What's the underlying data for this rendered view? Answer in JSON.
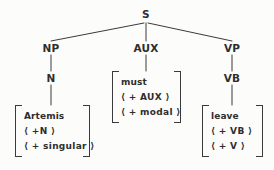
{
  "diagram": {
    "type": "phrase-structure-tree",
    "title": "",
    "background_color": "#fcfcfb",
    "line_color": "#3a3a3a",
    "text_color": "#2e2e2e"
  },
  "nodes": {
    "root": {
      "label": "S",
      "x": 146,
      "y": 14
    },
    "np": {
      "label": "NP",
      "x": 51,
      "y": 48
    },
    "aux": {
      "label": "AUX",
      "x": 146,
      "y": 48
    },
    "vp": {
      "label": "VP",
      "x": 232,
      "y": 48
    },
    "n": {
      "label": "N",
      "x": 51,
      "y": 78
    },
    "vb": {
      "label": "VB",
      "x": 232,
      "y": 78
    }
  },
  "matrices": {
    "np_matrix": {
      "rows": [
        {
          "text": "Artemis",
          "kind": "lexical"
        },
        {
          "text": "⟨ +N ⟩",
          "kind": "feature"
        },
        {
          "text": "⟨ + singular ⟩",
          "kind": "feature"
        }
      ],
      "x": 15,
      "y": 105,
      "width": 75,
      "height": 52
    },
    "aux_matrix": {
      "rows": [
        {
          "text": "must",
          "kind": "lexical"
        },
        {
          "text": "⟨ + AUX ⟩",
          "kind": "feature"
        },
        {
          "text": "⟨ + modal ⟩",
          "kind": "feature"
        }
      ],
      "x": 112,
      "y": 71,
      "width": 69,
      "height": 52
    },
    "vp_matrix": {
      "rows": [
        {
          "text": "leave",
          "kind": "lexical"
        },
        {
          "text": "⟨ + VB ⟩",
          "kind": "feature"
        },
        {
          "text": "⟨ + V ⟩",
          "kind": "feature"
        }
      ],
      "x": 202,
      "y": 105,
      "width": 61,
      "height": 52
    }
  },
  "edges": [
    {
      "from": "S",
      "to": "NP"
    },
    {
      "from": "S",
      "to": "AUX"
    },
    {
      "from": "S",
      "to": "VP"
    },
    {
      "from": "NP",
      "to": "N"
    },
    {
      "from": "N",
      "to": "np_matrix"
    },
    {
      "from": "AUX",
      "to": "aux_matrix"
    },
    {
      "from": "VP",
      "to": "VB"
    },
    {
      "from": "VB",
      "to": "vp_matrix"
    }
  ]
}
